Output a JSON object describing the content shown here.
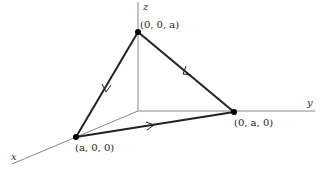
{
  "diagram": {
    "axes": {
      "x_label": "x",
      "y_label": "y",
      "z_label": "z"
    },
    "points": [
      {
        "id": "top",
        "label": "(0, 0, a)"
      },
      {
        "id": "left",
        "label": "(a, 0, 0)"
      },
      {
        "id": "right",
        "label": "(0, a, 0)"
      }
    ],
    "path_direction": "(0,0,a) → (a,0,0) → (0,a,0) → (0,0,a)",
    "colors": {
      "axis": "#888888",
      "edge": "#222222",
      "point": "#000000"
    }
  }
}
